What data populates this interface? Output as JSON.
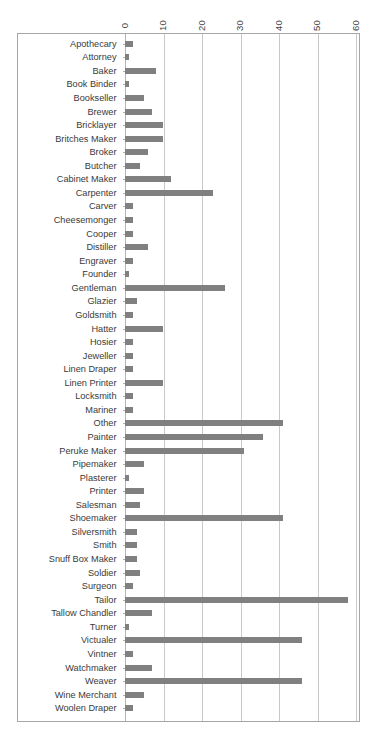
{
  "chart_data": {
    "type": "bar",
    "orientation": "horizontal",
    "title": "",
    "subtitle": "",
    "xlabel": "",
    "ylabel": "",
    "xlim": [
      0,
      60
    ],
    "ylim": null,
    "grid": "vertical",
    "legend": null,
    "legend_position": "none",
    "bar_color": "#808080",
    "axis_color": "#a6a6a6",
    "gridline_color": "#c9c9c9",
    "x_ticks": [
      "0",
      "10",
      "20",
      "30",
      "40",
      "50",
      "60"
    ],
    "x_tick_values": [
      0,
      10,
      20,
      30,
      40,
      50,
      60
    ],
    "x_tick_rotation": -90,
    "categories": [
      "Apothecary",
      "Attorney",
      "Baker",
      "Book Binder",
      "Bookseller",
      "Brewer",
      "Bricklayer",
      "Britches Maker",
      "Broker",
      "Butcher",
      "Cabinet Maker",
      "Carpenter",
      "Carver",
      "Cheesemonger",
      "Cooper",
      "Distiller",
      "Engraver",
      "Founder",
      "Gentleman",
      "Glazier",
      "Goldsmith",
      "Hatter",
      "Hosier",
      "Jeweller",
      "Linen Draper",
      "Linen Printer",
      "Locksmith",
      "Mariner",
      "Other",
      "Painter",
      "Peruke Maker",
      "Pipemaker",
      "Plasterer",
      "Printer",
      "Salesman",
      "Shoemaker",
      "Silversmith",
      "Smith",
      "Snuff Box Maker",
      "Soldier",
      "Surgeon",
      "Tailor",
      "Tallow Chandler",
      "Turner",
      "Victualer",
      "Vintner",
      "Watchmaker",
      "Weaver",
      "Wine Merchant",
      "Woolen Draper"
    ],
    "values": [
      2,
      1,
      8,
      1,
      5,
      7,
      10,
      10,
      6,
      4,
      12,
      23,
      2,
      2,
      2,
      6,
      2,
      1,
      26,
      3,
      2,
      10,
      2,
      2,
      2,
      10,
      2,
      2,
      41,
      36,
      31,
      5,
      1,
      5,
      4,
      41,
      3,
      3,
      3,
      4,
      2,
      58,
      7,
      1,
      46,
      2,
      7,
      46,
      5,
      2
    ]
  }
}
